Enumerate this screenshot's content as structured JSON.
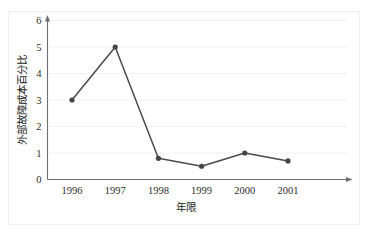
{
  "figure": {
    "ghost_caption": "",
    "background_color": "#ffffff",
    "frame_color": "#f1f1f3"
  },
  "chart_data": {
    "type": "line",
    "title": "",
    "xlabel": "年限",
    "ylabel": "外部故障成本百分比",
    "categories": [
      "1996",
      "1997",
      "1998",
      "1999",
      "2000",
      "2001"
    ],
    "values": [
      3.0,
      5.0,
      0.8,
      0.5,
      1.0,
      0.7
    ],
    "series": [
      {
        "name": "外部故障成本百分比",
        "values": [
          3.0,
          5.0,
          0.8,
          0.5,
          1.0,
          0.7
        ],
        "line_color": "#4a4a4a",
        "marker_color": "#454548",
        "marker": "circle"
      }
    ],
    "ylim": [
      0,
      6
    ],
    "yticks": [
      0,
      1,
      2,
      3,
      4,
      5,
      6
    ],
    "ytick_labels": [
      "0",
      "1",
      "2",
      "3",
      "4",
      "5",
      "6"
    ],
    "grid": true,
    "grid_axis": "y",
    "grid_color": "#f2f2f4",
    "legend": false,
    "legend_position": "none",
    "axis_arrows": [
      "x-right",
      "y-top"
    ],
    "annotations": []
  }
}
